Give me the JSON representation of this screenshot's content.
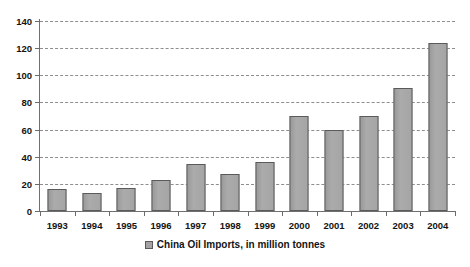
{
  "chart_data": {
    "type": "bar",
    "title": "",
    "xlabel": "",
    "ylabel": "",
    "categories": [
      "1993",
      "1994",
      "1995",
      "1996",
      "1997",
      "1998",
      "1999",
      "2000",
      "2001",
      "2002",
      "2003",
      "2004"
    ],
    "values": [
      16,
      13,
      17,
      23,
      35,
      27,
      36,
      70,
      60,
      70,
      91,
      124
    ],
    "series": [
      {
        "name": "China Oil Imports, in million tonnes",
        "values": [
          16,
          13,
          17,
          23,
          35,
          27,
          36,
          70,
          60,
          70,
          91,
          124
        ]
      }
    ],
    "ylim": [
      0,
      140
    ],
    "ytick_labels": [
      "140",
      "120",
      "100",
      "80",
      "60",
      "40",
      "20",
      "0"
    ],
    "ytick_values": [
      140,
      120,
      100,
      80,
      60,
      40,
      20,
      0
    ],
    "grid": true,
    "grid_style": "dashed",
    "legend_position": "bottom",
    "bar_color": "#a3a3a3",
    "bar_edge_color": "#5a5a5a",
    "grid_color": "#8e8e8e",
    "axis_color": "#707070",
    "background": "#ffffff"
  },
  "legend": {
    "entries": [
      {
        "label": "China Oil Imports, in million tonnes",
        "swatch_color": "#a3a3a3"
      }
    ]
  }
}
